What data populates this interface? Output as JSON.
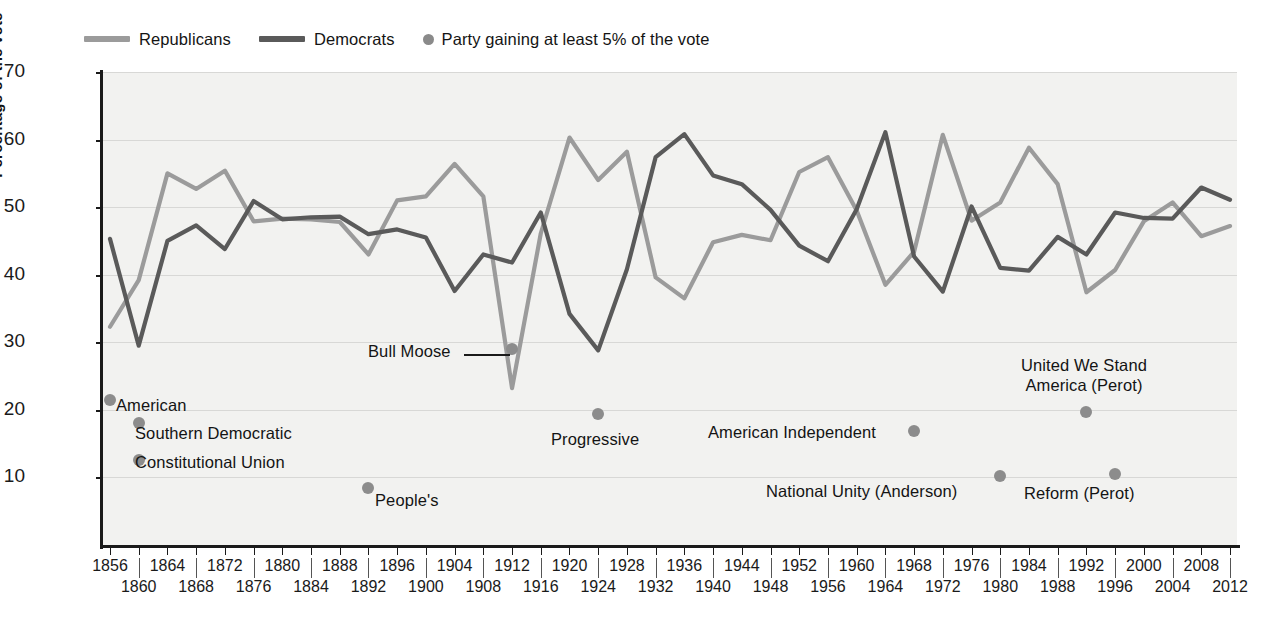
{
  "legend": {
    "items": [
      {
        "label": "Republicans",
        "type": "line",
        "color": "#9b9b9b"
      },
      {
        "label": "Democrats",
        "type": "line",
        "color": "#5a5a5a"
      },
      {
        "label": "Party gaining at least 5% of the vote",
        "type": "dot",
        "color": "#8a8a8a"
      }
    ]
  },
  "axes": {
    "ylabel": "Percentage of the vote",
    "yticks": [
      10,
      20,
      30,
      40,
      50,
      60,
      70
    ],
    "ylim": [
      0,
      70
    ],
    "xlim": [
      1856,
      2012
    ],
    "xticks": [
      1856,
      1860,
      1864,
      1868,
      1872,
      1876,
      1880,
      1884,
      1888,
      1892,
      1896,
      1900,
      1904,
      1908,
      1912,
      1916,
      1920,
      1924,
      1928,
      1932,
      1936,
      1940,
      1944,
      1948,
      1952,
      1956,
      1960,
      1964,
      1968,
      1972,
      1976,
      1980,
      1984,
      1988,
      1992,
      1996,
      2000,
      2004,
      2008,
      2012
    ]
  },
  "chart_data": {
    "type": "line",
    "title": "",
    "xlabel": "",
    "ylabel": "Percentage of the vote",
    "ylim": [
      0,
      70
    ],
    "xlim": [
      1856,
      2012
    ],
    "grid": true,
    "legend_position": "top-left",
    "x": [
      1856,
      1860,
      1864,
      1868,
      1872,
      1876,
      1880,
      1884,
      1888,
      1892,
      1896,
      1900,
      1904,
      1908,
      1912,
      1916,
      1920,
      1924,
      1928,
      1932,
      1936,
      1940,
      1944,
      1948,
      1952,
      1956,
      1960,
      1964,
      1968,
      1972,
      1976,
      1980,
      1984,
      1988,
      1992,
      1996,
      2000,
      2004,
      2008,
      2012
    ],
    "series": [
      {
        "name": "Republicans",
        "color": "#9b9b9b",
        "values": [
          32.3,
          39.2,
          55.0,
          52.7,
          55.4,
          47.9,
          48.3,
          48.2,
          47.8,
          43.0,
          51.0,
          51.6,
          56.4,
          51.6,
          23.2,
          46.1,
          60.3,
          54.0,
          58.2,
          39.6,
          36.5,
          44.8,
          45.9,
          45.1,
          55.2,
          57.4,
          49.5,
          38.5,
          43.4,
          60.7,
          48.0,
          50.7,
          58.8,
          53.4,
          37.4,
          40.7,
          47.9,
          50.7,
          45.7,
          47.2
        ]
      },
      {
        "name": "Democrats",
        "color": "#5a5a5a",
        "values": [
          45.3,
          29.5,
          45.0,
          47.3,
          43.8,
          50.9,
          48.2,
          48.5,
          48.6,
          46.0,
          46.7,
          45.5,
          37.6,
          43.0,
          41.8,
          49.2,
          34.2,
          28.8,
          40.8,
          57.4,
          60.8,
          54.7,
          53.4,
          49.6,
          44.3,
          42.0,
          49.7,
          61.1,
          42.7,
          37.5,
          50.1,
          41.0,
          40.6,
          45.6,
          43.0,
          49.2,
          48.4,
          48.3,
          52.9,
          51.1
        ]
      }
    ],
    "third_parties": [
      {
        "label": "American",
        "year": 1856,
        "value": 21.5,
        "text_anchor": "left"
      },
      {
        "label": "Southern Democratic",
        "year": 1860,
        "value": 18.1,
        "text_anchor": "left"
      },
      {
        "label": "Constitutional Union",
        "year": 1860,
        "value": 12.6,
        "text_anchor": "left"
      },
      {
        "label": "People's",
        "year": 1892,
        "value": 8.5,
        "text_anchor": "left"
      },
      {
        "label": "Bull Moose",
        "year": 1912,
        "value": 29.0,
        "text_anchor": "leader-left"
      },
      {
        "label": "Progressive",
        "year": 1924,
        "value": 19.4,
        "text_anchor": "below-left"
      },
      {
        "label": "American Independent",
        "year": 1968,
        "value": 16.8,
        "text_anchor": "right"
      },
      {
        "label": "National Unity (Anderson)",
        "year": 1980,
        "value": 10.2,
        "text_anchor": "right"
      },
      {
        "label": "United We Stand America (Perot)",
        "year": 1992,
        "value": 19.7,
        "text_anchor": "above-center"
      },
      {
        "label": "Reform (Perot)",
        "year": 1996,
        "value": 10.5,
        "text_anchor": "below-right"
      }
    ]
  },
  "annotations": {
    "american": "American",
    "southern_democratic": "Southern Democratic",
    "constitutional_union": "Constitutional Union",
    "peoples": "People's",
    "bull_moose": "Bull Moose",
    "progressive": "Progressive",
    "american_independent": "American Independent",
    "national_unity": "National Unity (Anderson)",
    "united_we_stand_line1": "United We Stand",
    "united_we_stand_line2": "America (Perot)",
    "reform": "Reform (Perot)"
  }
}
